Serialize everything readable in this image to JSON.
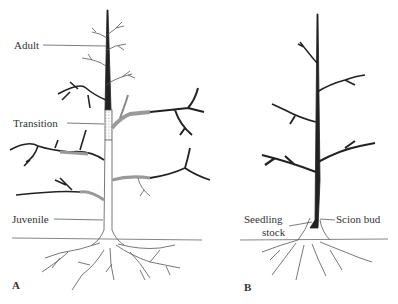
{
  "figure": {
    "panel_a": {
      "letter": "A",
      "labels": {
        "adult": "Adult",
        "transition": "Transition",
        "juvenile": "Juvenile"
      }
    },
    "panel_b": {
      "letter": "B",
      "labels": {
        "seedling_line1": "Seedling",
        "seedling_line2": "stock",
        "scion_bud": "Scion bud"
      }
    },
    "colors": {
      "ink": "#2a2a2a",
      "outline": "#555555",
      "stipple": "#bbbbbb"
    }
  }
}
